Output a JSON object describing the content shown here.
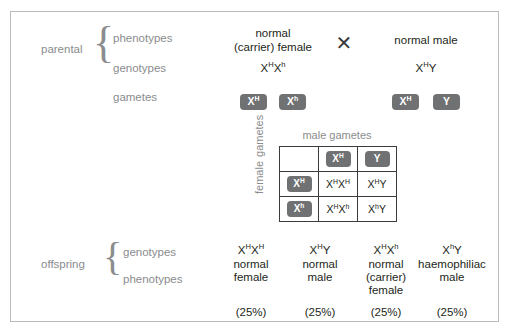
{
  "figure": {
    "parental": {
      "group_label": "parental",
      "row_labels": {
        "phenotypes": "phenotypes",
        "genotypes": "genotypes",
        "gametes": "gametes"
      },
      "cross_symbol": "✕",
      "mother": {
        "phenotype_line1": "normal",
        "phenotype_line2": "(carrier) female",
        "genotype_base1": "X",
        "genotype_sup1": "H",
        "genotype_base2": "X",
        "genotype_sup2": "h",
        "gametes": [
          {
            "base": "X",
            "sup": "H"
          },
          {
            "base": "X",
            "sup": "h"
          }
        ]
      },
      "father": {
        "phenotype_line1": "normal male",
        "genotype_base1": "X",
        "genotype_sup1": "H",
        "genotype_base2": "Y",
        "genotype_sup2": "",
        "gametes": [
          {
            "base": "X",
            "sup": "H"
          },
          {
            "base": "Y",
            "sup": ""
          }
        ]
      }
    },
    "punnett": {
      "top_heading": "male gametes",
      "side_heading_line1": "female",
      "side_heading_line2": "gametes",
      "male_gametes": [
        {
          "base": "X",
          "sup": "H"
        },
        {
          "base": "Y",
          "sup": ""
        }
      ],
      "female_gametes": [
        {
          "base": "X",
          "sup": "H"
        },
        {
          "base": "X",
          "sup": "h"
        }
      ],
      "cells": [
        [
          {
            "b1": "X",
            "s1": "H",
            "b2": "X",
            "s2": "H"
          },
          {
            "b1": "X",
            "s1": "H",
            "b2": "Y",
            "s2": ""
          }
        ],
        [
          {
            "b1": "X",
            "s1": "H",
            "b2": "X",
            "s2": "h"
          },
          {
            "b1": "X",
            "s1": "h",
            "b2": "Y",
            "s2": ""
          }
        ]
      ]
    },
    "offspring": {
      "group_label": "offspring",
      "row_labels": {
        "genotypes": "genotypes",
        "phenotypes": "phenotypes"
      },
      "columns": [
        {
          "genotype_b1": "X",
          "genotype_s1": "H",
          "genotype_b2": "X",
          "genotype_s2": "H",
          "phenotype_lines": [
            "normal",
            "female"
          ],
          "percent": "(25%)"
        },
        {
          "genotype_b1": "X",
          "genotype_s1": "H",
          "genotype_b2": "Y",
          "genotype_s2": "",
          "phenotype_lines": [
            "normal",
            "male"
          ],
          "percent": "(25%)"
        },
        {
          "genotype_b1": "X",
          "genotype_s1": "H",
          "genotype_b2": "X",
          "genotype_s2": "h",
          "phenotype_lines": [
            "normal",
            "(carrier)",
            "female"
          ],
          "percent": "(25%)"
        },
        {
          "genotype_b1": "X",
          "genotype_s1": "h",
          "genotype_b2": "Y",
          "genotype_s2": "",
          "phenotype_lines": [
            "haemophiliac",
            "male"
          ],
          "percent": "(25%)"
        }
      ]
    },
    "colors": {
      "frame_border": "#b9bbbd",
      "chip_fill": "#6f7173",
      "chip_text": "#ffffff",
      "label_gray": "#8a8c8e",
      "body_text": "#231f20",
      "grid_border": "#3b3b3d"
    }
  }
}
